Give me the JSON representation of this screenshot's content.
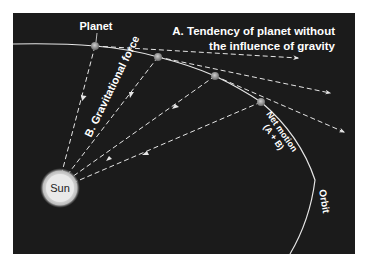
{
  "diagram": {
    "type": "orbital-mechanics",
    "background_color": "#1b1b1b",
    "line_color": "#e6e6e6",
    "labels": {
      "planet": "Planet",
      "tendency_line1": "A. Tendency of planet without",
      "tendency_line2": "the influence of gravity",
      "gravitational_force": "B. Gravitational force",
      "net_motion_line1": "Net motion",
      "net_motion_line2": "(A + B)",
      "sun": "Sun",
      "orbit": "Orbit"
    },
    "bodies": {
      "sun": {
        "label": "Sun",
        "color": "#e8e8e8"
      },
      "planet_positions": 4
    },
    "arrows": {
      "tangent_dashed": 3,
      "gravity_toward_sun": 4
    }
  }
}
